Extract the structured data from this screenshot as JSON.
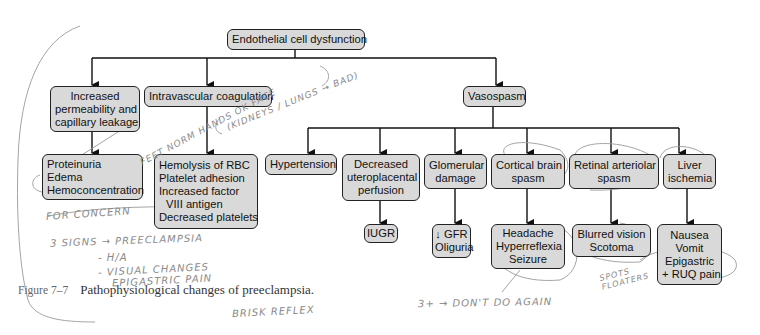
{
  "diagram": {
    "root": {
      "label": "Endothelial cell dysfunction"
    },
    "level1": [
      {
        "id": "permeability",
        "lines": [
          "Increased",
          "permeability and",
          "capillary leakage"
        ]
      },
      {
        "id": "coagulation",
        "lines": [
          "Intravascular coagulation"
        ]
      },
      {
        "id": "vasospasm",
        "lines": [
          "Vasospasm"
        ]
      }
    ],
    "level2": [
      {
        "id": "proteinuria",
        "parent": "permeability",
        "lines": [
          "Proteinuria",
          "Edema",
          "Hemoconcentration"
        ]
      },
      {
        "id": "hemolysis",
        "parent": "coagulation",
        "lines": [
          "Hemolysis of RBC",
          "Platelet adhesion",
          "Increased factor",
          "  VIII antigen",
          "Decreased platelets"
        ]
      },
      {
        "id": "hypertension",
        "parent": "vasospasm",
        "lines": [
          "Hypertension"
        ]
      },
      {
        "id": "uteroplacental",
        "parent": "vasospasm",
        "lines": [
          "Decreased",
          "uteroplacental",
          "perfusion"
        ]
      },
      {
        "id": "glomerular",
        "parent": "vasospasm",
        "lines": [
          "Glomerular",
          "damage"
        ]
      },
      {
        "id": "cortical",
        "parent": "vasospasm",
        "lines": [
          "Cortical brain",
          "spasm"
        ]
      },
      {
        "id": "retinal",
        "parent": "vasospasm",
        "lines": [
          "Retinal arteriolar",
          "spasm"
        ]
      },
      {
        "id": "liver",
        "parent": "vasospasm",
        "lines": [
          "Liver",
          "ischemia"
        ]
      }
    ],
    "level3": [
      {
        "id": "iugr",
        "parent": "uteroplacental",
        "lines": [
          "IUGR"
        ]
      },
      {
        "id": "gfr",
        "parent": "glomerular",
        "lines": [
          "↓ GFR",
          "Oliguria"
        ]
      },
      {
        "id": "headache",
        "parent": "cortical",
        "lines": [
          "Headache",
          "Hyperreflexia",
          "Seizure"
        ]
      },
      {
        "id": "vision",
        "parent": "retinal",
        "lines": [
          "Blurred vision",
          "Scotoma"
        ]
      },
      {
        "id": "nausea",
        "parent": "liver",
        "lines": [
          "Nausea",
          "Vomit",
          "Epigastric",
          "+ RUQ pain"
        ]
      }
    ]
  },
  "caption": {
    "figure_number": "Figure 7–7",
    "text": "Pathophysiological changes of preeclampsia."
  },
  "handwritten_notes": [
    {
      "id": "note-feet",
      "text": "FEET NORM HANDS OK FACE"
    },
    {
      "id": "note-kidneys",
      "text": "(KIDNEYS / LUNGS → BAD)"
    },
    {
      "id": "note-concern",
      "text": "FOR CONCERN"
    },
    {
      "id": "note-signs",
      "text": "3 SIGNS → PREECLAMPSIA"
    },
    {
      "id": "note-ha",
      "text": "- H/A"
    },
    {
      "id": "note-visual",
      "text": "- VISUAL CHANGES"
    },
    {
      "id": "note-epigastric",
      "text": "EPIGASTRIC PAIN"
    },
    {
      "id": "note-brisk",
      "text": "BRISK REFLEX"
    },
    {
      "id": "note-dontdo",
      "text": "3+ → DON'T DO AGAIN"
    },
    {
      "id": "note-spots",
      "text": "SPOTS FLOATERS"
    }
  ],
  "colors": {
    "box_fill": "#d9d9d9",
    "box_border": "#222222",
    "line": "#111111",
    "pencil": "#8a8a8a"
  }
}
